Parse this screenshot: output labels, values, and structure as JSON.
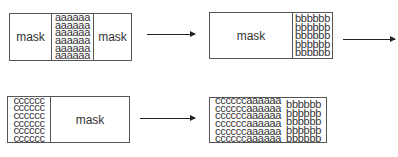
{
  "diagram": {
    "box1": {
      "left_label": "mask",
      "center_lines": [
        "aaaaaa",
        "aaaaaa",
        "aaaaaa",
        "aaaaaa",
        "aaaaaa",
        "aaaaaa"
      ],
      "right_label": "mask"
    },
    "box2": {
      "left_label": "mask",
      "right_lines": [
        "bbbbbb",
        "bbbbbb",
        "bbbbbb",
        "bbbbbb",
        "bbbbbb"
      ]
    },
    "box3": {
      "left_lines": [
        "cccccc",
        "cccccc",
        "cccccc",
        "cccccc",
        "cccccc",
        "cccccc"
      ],
      "right_label": "mask"
    },
    "box4": {
      "c_lines": [
        "cccccc",
        "cccccc",
        "cccccc",
        "cccccc",
        "cccccc",
        "cccccc"
      ],
      "a_lines": [
        "aaaaaa",
        "aaaaaa",
        "aaaaaa",
        "aaaaaa",
        "aaaaaa",
        "aaaaaa"
      ],
      "b_lines": [
        "bbbbbb",
        "bbbbbb",
        "bbbbbb",
        "bbbbbb",
        "bbbbbb"
      ]
    },
    "arrows": [
      "arrow-1",
      "arrow-2",
      "arrow-3"
    ]
  }
}
